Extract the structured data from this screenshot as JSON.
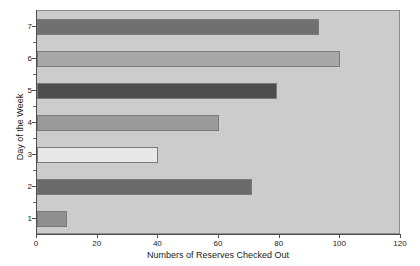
{
  "chart_data": {
    "type": "bar",
    "orientation": "horizontal",
    "title": "",
    "xlabel": "Numbers of Reserves Checked Out",
    "ylabel": "Day of the Week",
    "categories": [
      "1",
      "2",
      "3",
      "4",
      "5",
      "6",
      "7"
    ],
    "values": [
      10,
      71,
      40,
      60,
      79,
      100,
      93
    ],
    "xlim": [
      0,
      120
    ],
    "xticks": [
      "0",
      "20",
      "40",
      "60",
      "80",
      "100",
      "120"
    ],
    "yticks": [
      "1",
      "2",
      "3",
      "4",
      "5",
      "6",
      "7"
    ],
    "grid": false,
    "legend": "none",
    "bar_colors": [
      "#8f8f8f",
      "#6a6a6a",
      "#e8e8e8",
      "#9a9a9a",
      "#4d4d4d",
      "#a8a8a8",
      "#707070"
    ],
    "plot_background": "#cccccc",
    "figure_background": "#ffffff",
    "axis_color": "#4d4d4d",
    "bars": [
      {
        "category": "1",
        "value": 10,
        "color": "#8f8f8f"
      },
      {
        "category": "2",
        "value": 71,
        "color": "#6a6a6a"
      },
      {
        "category": "3",
        "value": 40,
        "color": "#e8e8e8"
      },
      {
        "category": "4",
        "value": 60,
        "color": "#9a9a9a"
      },
      {
        "category": "5",
        "value": 79,
        "color": "#4d4d4d"
      },
      {
        "category": "6",
        "value": 100,
        "color": "#a8a8a8"
      },
      {
        "category": "7",
        "value": 93,
        "color": "#707070"
      }
    ]
  }
}
